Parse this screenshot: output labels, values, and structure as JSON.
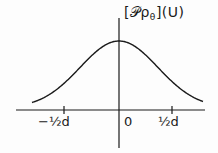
{
  "chart_data": {
    "type": "line",
    "title": "",
    "ylabel": "[𝒫ρθ](U)",
    "ylabel_parts": {
      "open": "[",
      "operator": "𝒫",
      "func": "ρ",
      "subscript": "θ",
      "close": "]",
      "arg": "(U)"
    },
    "xlabel": "",
    "x_ticks": [
      "-½d",
      "0",
      "½d"
    ],
    "x_tick_positions": [
      -0.5,
      0,
      0.5
    ],
    "curve": "bell-shaped (Gaussian-like) profile centered at 0, symmetric, decaying to near zero beyond ±½d",
    "x": [
      -1.0,
      -0.75,
      -0.5,
      -0.25,
      0,
      0.25,
      0.5,
      0.75,
      1.0
    ],
    "values": [
      0.02,
      0.1,
      0.3,
      0.75,
      1.0,
      0.75,
      0.3,
      0.1,
      0.02
    ],
    "grid": false,
    "legend": null,
    "colors": {
      "line": "#1a1a1a",
      "background": "#fdfdfd"
    }
  },
  "labels": {
    "ylabel_open": "[",
    "ylabel_op": "𝒫ρ",
    "ylabel_sub": "θ",
    "ylabel_close": "](U)",
    "tick_neg": "−½d",
    "tick_zero": "0",
    "tick_pos": "½d"
  }
}
